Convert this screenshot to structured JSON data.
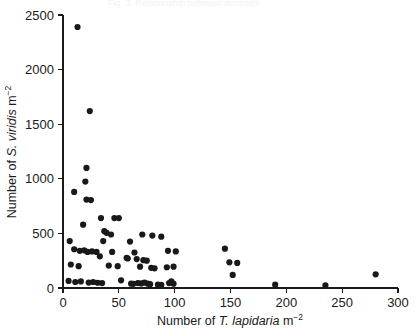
{
  "figure": {
    "background": "#ffffff",
    "marker_color": "#191919",
    "axis_color": "#1a1a1a",
    "ghost_caption": "Fig. 3. Relationship between densities"
  },
  "chart_data": {
    "type": "scatter",
    "title": "",
    "subtitle": "",
    "xlabel": "Number of T. lapidaria m-2",
    "xlabel_parts": {
      "prefix": "Number of ",
      "italic": "T. lapidaria",
      "suffix": " m",
      "superscript": "−2"
    },
    "ylabel": "Number of S. viridis m-2",
    "ylabel_parts": {
      "prefix": "Number of ",
      "italic": "S. viridis",
      "suffix": " m",
      "superscript": "−2"
    },
    "xlim": [
      0,
      300
    ],
    "ylim": [
      0,
      2500
    ],
    "xticks": [
      0,
      50,
      100,
      150,
      200,
      250,
      300
    ],
    "yticks": [
      0,
      500,
      1000,
      1500,
      2000,
      2500
    ],
    "xtick_labels": [
      "0",
      "50",
      "100",
      "150",
      "200",
      "250",
      "300"
    ],
    "ytick_labels": [
      "0",
      "500",
      "1000",
      "1500",
      "2000",
      "2500"
    ],
    "grid": false,
    "legend": null,
    "marker": "filled-circle",
    "marker_size": 3.6,
    "n_points": 72,
    "points": [
      [
        13,
        2390
      ],
      [
        24,
        1620
      ],
      [
        21,
        1100
      ],
      [
        20,
        975
      ],
      [
        10,
        880
      ],
      [
        21,
        810
      ],
      [
        25,
        805
      ],
      [
        34,
        640
      ],
      [
        46,
        640
      ],
      [
        50,
        640
      ],
      [
        18,
        580
      ],
      [
        37,
        520
      ],
      [
        39,
        505
      ],
      [
        43,
        490
      ],
      [
        71,
        490
      ],
      [
        80,
        480
      ],
      [
        88,
        470
      ],
      [
        6,
        430
      ],
      [
        36,
        430
      ],
      [
        60,
        425
      ],
      [
        10,
        355
      ],
      [
        15,
        340
      ],
      [
        19,
        345
      ],
      [
        22,
        330
      ],
      [
        26,
        335
      ],
      [
        30,
        330
      ],
      [
        44,
        330
      ],
      [
        64,
        325
      ],
      [
        94,
        340
      ],
      [
        101,
        335
      ],
      [
        145,
        360
      ],
      [
        33,
        290
      ],
      [
        57,
        275
      ],
      [
        58,
        270
      ],
      [
        66,
        265
      ],
      [
        72,
        255
      ],
      [
        75,
        250
      ],
      [
        149,
        235
      ],
      [
        156,
        230
      ],
      [
        7,
        215
      ],
      [
        14,
        200
      ],
      [
        41,
        205
      ],
      [
        49,
        200
      ],
      [
        69,
        195
      ],
      [
        79,
        185
      ],
      [
        82,
        180
      ],
      [
        93,
        190
      ],
      [
        99,
        195
      ],
      [
        152,
        120
      ],
      [
        280,
        125
      ],
      [
        5,
        65
      ],
      [
        11,
        55
      ],
      [
        16,
        60
      ],
      [
        23,
        50
      ],
      [
        27,
        55
      ],
      [
        31,
        48
      ],
      [
        35,
        45
      ],
      [
        52,
        70
      ],
      [
        61,
        40
      ],
      [
        63,
        38
      ],
      [
        67,
        45
      ],
      [
        70,
        42
      ],
      [
        73,
        50
      ],
      [
        76,
        40
      ],
      [
        78,
        35
      ],
      [
        85,
        30
      ],
      [
        88,
        28
      ],
      [
        95,
        45
      ],
      [
        97,
        60
      ],
      [
        99,
        40
      ],
      [
        190,
        30
      ],
      [
        235,
        25
      ]
    ]
  }
}
